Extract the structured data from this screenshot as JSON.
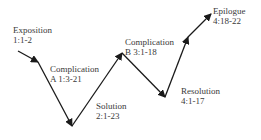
{
  "diagram": {
    "type": "narrative-plot-line",
    "stages": [
      {
        "name": "Exposition",
        "ref": "1:1-2"
      },
      {
        "name": "Complication A",
        "ref": "1:3-21"
      },
      {
        "name": "Solution",
        "ref": "2:1-23"
      },
      {
        "name": "Complication B",
        "ref": "3:1-18"
      },
      {
        "name": "Resolution",
        "ref": "4:1-17"
      },
      {
        "name": "Epilogue",
        "ref": "4:18-22"
      }
    ],
    "labels": {
      "exposition_l1": "Exposition",
      "exposition_l2": "1:1-2",
      "complication_a_l1": "Complication",
      "complication_a_l2": "A 1:3-21",
      "solution_l1": "Solution",
      "solution_l2": "2:1-23",
      "complication_b_l1": "Complication",
      "complication_b_l2": "B 3:1-18",
      "resolution_l1": "Resolution",
      "resolution_l2": "4:1-17",
      "epilogue_l1": "Epilogue",
      "epilogue_l2": "4:18-22"
    },
    "line_color": "#1a1a1a"
  }
}
